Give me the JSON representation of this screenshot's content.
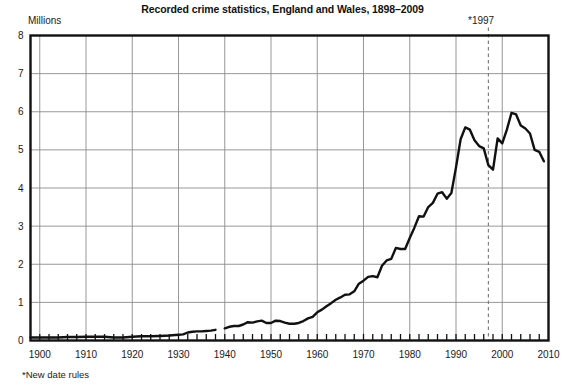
{
  "chart_data": {
    "type": "line",
    "title": "Recorded crime statistics, England and Wales, 1898–2009",
    "xlabel": "",
    "ylabel": "Millions",
    "ylim": [
      0,
      8
    ],
    "xlim": [
      1898,
      2010
    ],
    "grid": true,
    "legend": null,
    "yticks": [
      0,
      1,
      2,
      3,
      4,
      5,
      6,
      7,
      8
    ],
    "ytick_labels": [
      "0",
      "1",
      "2",
      "3",
      "4",
      "5",
      "6",
      "7",
      "8"
    ],
    "xticks": [
      1900,
      1910,
      1920,
      1930,
      1940,
      1950,
      1960,
      1970,
      1980,
      1990,
      2000,
      2010
    ],
    "xtick_labels": [
      "1900",
      "1910",
      "1920",
      "1930",
      "1940",
      "1950",
      "1960",
      "1970",
      "1980",
      "1990",
      "2000",
      "2010"
    ],
    "minor_xtick_interval": 2,
    "annotations": [
      {
        "name": "new-date-rules-marker",
        "label": "*1997",
        "x": 1997,
        "style": "vertical-dashed-line"
      }
    ],
    "footnote": "*New date rules",
    "series": [
      {
        "name": "Recorded crime (millions)",
        "color": "#111111",
        "segments": [
          {
            "name": "1898-1938",
            "x": [
              1898,
              1900,
              1902,
              1904,
              1906,
              1908,
              1910,
              1912,
              1914,
              1916,
              1918,
              1920,
              1922,
              1924,
              1926,
              1928,
              1930,
              1931,
              1932,
              1933,
              1934,
              1935,
              1936,
              1937,
              1938
            ],
            "y": [
              0.08,
              0.08,
              0.08,
              0.08,
              0.09,
              0.09,
              0.1,
              0.1,
              0.1,
              0.08,
              0.08,
              0.1,
              0.11,
              0.11,
              0.12,
              0.13,
              0.15,
              0.16,
              0.21,
              0.23,
              0.24,
              0.24,
              0.25,
              0.26,
              0.28
            ]
          },
          {
            "name": "1940-2009",
            "x": [
              1940,
              1941,
              1942,
              1943,
              1944,
              1945,
              1946,
              1947,
              1948,
              1949,
              1950,
              1951,
              1952,
              1953,
              1954,
              1955,
              1956,
              1957,
              1958,
              1959,
              1960,
              1961,
              1962,
              1963,
              1964,
              1965,
              1966,
              1967,
              1968,
              1969,
              1970,
              1971,
              1972,
              1973,
              1974,
              1975,
              1976,
              1977,
              1978,
              1979,
              1980,
              1981,
              1982,
              1983,
              1984,
              1985,
              1986,
              1987,
              1988,
              1989,
              1990,
              1991,
              1992,
              1993,
              1994,
              1995,
              1996,
              1997,
              1998,
              1999,
              2000,
              2001,
              2002,
              2003,
              2004,
              2005,
              2006,
              2007,
              2008,
              2009
            ],
            "y": [
              0.32,
              0.36,
              0.38,
              0.38,
              0.42,
              0.48,
              0.47,
              0.5,
              0.52,
              0.46,
              0.46,
              0.52,
              0.51,
              0.47,
              0.44,
              0.44,
              0.46,
              0.51,
              0.58,
              0.62,
              0.74,
              0.81,
              0.9,
              0.98,
              1.07,
              1.13,
              1.2,
              1.21,
              1.29,
              1.49,
              1.57,
              1.67,
              1.69,
              1.66,
              1.96,
              2.1,
              2.14,
              2.43,
              2.4,
              2.4,
              2.69,
              2.96,
              3.26,
              3.25,
              3.5,
              3.61,
              3.85,
              3.89,
              3.72,
              3.87,
              4.54,
              5.28,
              5.59,
              5.53,
              5.25,
              5.1,
              5.04,
              4.6,
              4.48,
              5.3,
              5.17,
              5.53,
              5.97,
              5.93,
              5.64,
              5.56,
              5.43,
              5.0,
              4.95,
              4.7
            ]
          }
        ]
      }
    ]
  },
  "labels": {
    "unit": "Millions",
    "annotation": "*1997",
    "footnote": "*New date rules"
  },
  "colors": {
    "line": "#111111",
    "grid": "#8c8c8c",
    "axis": "#111111",
    "background": "#ffffff",
    "dashed_marker": "#777777"
  }
}
